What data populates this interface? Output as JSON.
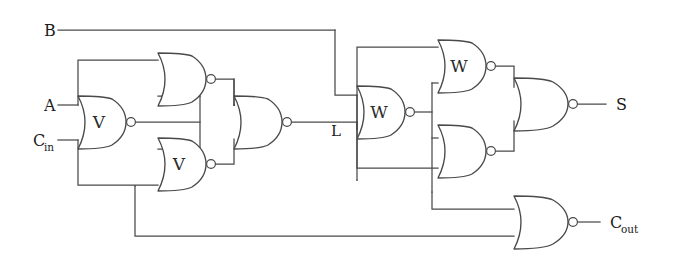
{
  "diagram": {
    "background_color": "#ffffff",
    "line_color": "#4a4a4a",
    "text_color": "#1c1c1c",
    "width": 686,
    "height": 260
  },
  "inputs": [
    {
      "id": "in-b",
      "label": "B",
      "subscript": "",
      "x": 44,
      "y": 30
    },
    {
      "id": "in-a",
      "label": "A",
      "subscript": "",
      "x": 44,
      "y": 105
    },
    {
      "id": "in-cin",
      "label": "C",
      "subscript": "in",
      "x": 33,
      "y": 140
    }
  ],
  "outputs": [
    {
      "id": "out-s",
      "label": "S",
      "subscript": "",
      "x": 620,
      "y": 104
    },
    {
      "id": "out-cout",
      "label": "C",
      "subscript": "out",
      "x": 612,
      "y": 222
    }
  ],
  "internal_nodes": [
    {
      "id": "node-l",
      "label": "L",
      "x": 335,
      "y": 131
    }
  ],
  "gates": [
    {
      "id": "gate-v1",
      "letter": "V",
      "type": "nor",
      "position": "left-middle",
      "cx": 92,
      "cy": 122
    },
    {
      "id": "gate-n1",
      "letter": "",
      "type": "nor",
      "position": "left-upper",
      "cx": 172,
      "cy": 79
    },
    {
      "id": "gate-v2",
      "letter": "V",
      "type": "nor",
      "position": "left-lower",
      "cx": 172,
      "cy": 164
    },
    {
      "id": "gate-n2",
      "letter": "",
      "type": "nor",
      "position": "left-output",
      "cx": 248,
      "cy": 122
    },
    {
      "id": "gate-w1",
      "letter": "W",
      "type": "nor",
      "position": "right-middle",
      "cx": 372,
      "cy": 112
    },
    {
      "id": "gate-w2",
      "letter": "W",
      "type": "nor",
      "position": "right-upper",
      "cx": 452,
      "cy": 66
    },
    {
      "id": "gate-n3",
      "letter": "",
      "type": "nor",
      "position": "right-lower",
      "cx": 452,
      "cy": 151
    },
    {
      "id": "gate-n4",
      "letter": "",
      "type": "nor",
      "position": "sum-output",
      "cx": 532,
      "cy": 104
    },
    {
      "id": "gate-n5",
      "letter": "",
      "type": "nor",
      "position": "carry-output",
      "cx": 532,
      "cy": 222
    }
  ],
  "gate_letters": {
    "v": "V",
    "w": "W"
  }
}
